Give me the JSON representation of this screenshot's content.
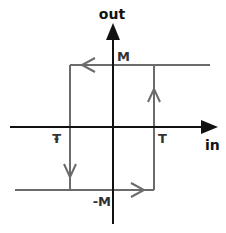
{
  "diagram": {
    "axes": {
      "x_label": "in",
      "y_label": "out"
    },
    "labels": {
      "upper_level": "M",
      "lower_level": "-M",
      "upper_threshold": "T",
      "lower_threshold": "-T"
    },
    "colors": {
      "axis": "#111111",
      "loop": "#6b6b6b",
      "background": "#ffffff"
    },
    "loop_arrows": [
      {
        "segment": "top",
        "direction": "left"
      },
      {
        "segment": "right-vertical",
        "direction": "up"
      },
      {
        "segment": "left-vertical",
        "direction": "down"
      },
      {
        "segment": "bottom",
        "direction": "right"
      }
    ]
  }
}
